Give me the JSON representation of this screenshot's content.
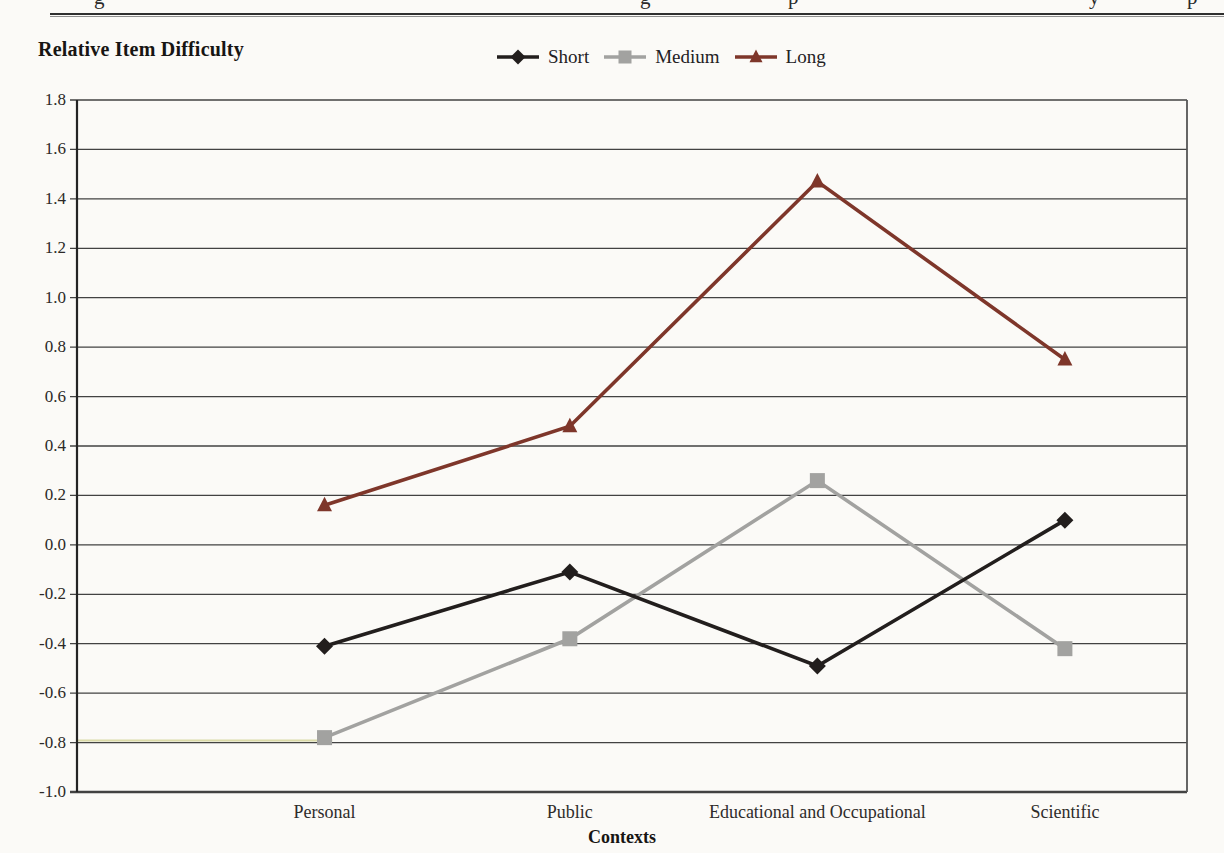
{
  "page": {
    "cropped_top_text_fragments": [
      {
        "glyph": "g",
        "x": 94
      },
      {
        "glyph": "g",
        "x": 640
      },
      {
        "glyph": "p",
        "x": 788
      },
      {
        "glyph": "y",
        "x": 1089
      },
      {
        "glyph": "p",
        "x": 1187
      }
    ]
  },
  "chart_data": {
    "type": "line",
    "title": "Relative Item Difficulty",
    "xlabel": "Contexts",
    "ylabel": "",
    "categories": [
      "Personal",
      "Public",
      "Educational and Occupational",
      "Scientific"
    ],
    "series": [
      {
        "name": "Short",
        "marker": "diamond",
        "color": "#221e1d",
        "values": [
          -0.41,
          -0.11,
          -0.49,
          0.1
        ]
      },
      {
        "name": "Medium",
        "marker": "square",
        "color": "#a2a2a0",
        "values": [
          -0.78,
          -0.38,
          0.26,
          -0.42
        ]
      },
      {
        "name": "Long",
        "marker": "triangle",
        "color": "#7e362a",
        "values": [
          0.16,
          0.48,
          1.47,
          0.75
        ]
      }
    ],
    "ylim": [
      -1.0,
      1.8
    ],
    "ytick_step": 0.2,
    "yticks": [
      "1.8",
      "1.6",
      "1.4",
      "1.2",
      "1.0",
      "0.8",
      "0.6",
      "0.4",
      "0.2",
      "0.0",
      "-0.2",
      "-0.4",
      "-0.6",
      "-0.8",
      "-1.0"
    ],
    "grid": "horizontal",
    "legend_position": "top-center",
    "category_fractions": [
      0.223,
      0.444,
      0.667,
      0.89
    ],
    "colors": {
      "gridline": "#424242",
      "axis": "#242424",
      "scan_fringe": "#d6d59b"
    },
    "scan_artifacts": {
      "yellow_fringe": {
        "value": -0.8,
        "x_extent_fraction": 0.23
      }
    }
  }
}
